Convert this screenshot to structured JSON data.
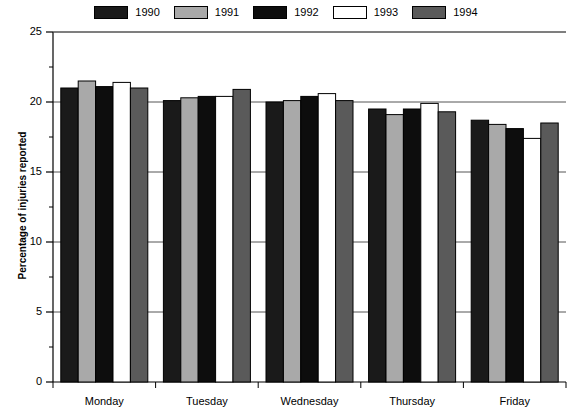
{
  "chart_data": {
    "type": "bar",
    "title": "",
    "subtitle": "",
    "xlabel": "",
    "ylabel": "Percentage of injuries reported",
    "categories": [
      "Monday",
      "Tuesday",
      "Wednesday",
      "Thursday",
      "Friday"
    ],
    "series": [
      {
        "name": "1990",
        "color": "#1a1a1a",
        "values": [
          21.0,
          20.1,
          20.0,
          19.5,
          18.7
        ]
      },
      {
        "name": "1991",
        "color": "#a9a9a9",
        "values": [
          21.5,
          20.3,
          20.1,
          19.1,
          18.4
        ]
      },
      {
        "name": "1992",
        "color": "#0d0d0d",
        "values": [
          21.1,
          20.4,
          20.4,
          19.5,
          18.1
        ]
      },
      {
        "name": "1993",
        "color": "#ffffff",
        "values": [
          21.4,
          20.4,
          20.6,
          19.9,
          17.4
        ]
      },
      {
        "name": "1994",
        "color": "#5a5a5a",
        "values": [
          21.0,
          20.9,
          20.1,
          19.3,
          18.5
        ]
      }
    ],
    "ylim": [
      0,
      25
    ],
    "y_major_ticks": [
      0,
      5,
      10,
      15,
      20,
      25
    ],
    "y_minor_ticks": [
      2.5,
      7.5,
      12.5,
      17.5,
      22.5
    ],
    "y_tick_labels": [
      "0",
      "5",
      "10",
      "15",
      "20",
      "25"
    ],
    "grid": true,
    "grid_axis": "y",
    "legend_position": "top",
    "bar_edge_color": "#000000",
    "axis_color": "#000000",
    "grid_color": "#555555",
    "background": "#ffffff"
  },
  "legend": {
    "entries": [
      {
        "label": "1990"
      },
      {
        "label": "1991"
      },
      {
        "label": "1992"
      },
      {
        "label": "1993"
      },
      {
        "label": "1994"
      }
    ]
  },
  "axes": {
    "y_title": "Percentage of injuries reported"
  }
}
